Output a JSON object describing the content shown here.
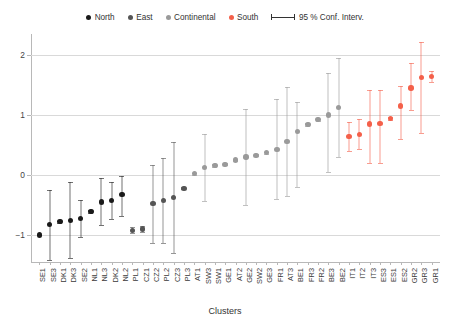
{
  "legend": {
    "items": [
      {
        "label": "North",
        "color": "#1a1a1a",
        "icon": "dot-icon"
      },
      {
        "label": "East",
        "color": "#555555",
        "icon": "dot-icon"
      },
      {
        "label": "Continental",
        "color": "#9a9a9a",
        "icon": "dot-icon"
      },
      {
        "label": "South",
        "color": "#f4604a",
        "icon": "dot-icon"
      }
    ],
    "ci_label": "95 % Conf. Interv.",
    "ci_icon": "error-bar-icon"
  },
  "axes": {
    "x_title": "Clusters",
    "y_ticks": [
      "2",
      "1",
      "0",
      "-1"
    ],
    "y_tick_values": [
      2,
      1,
      0,
      -1
    ],
    "ylim": [
      -1.45,
      2.35
    ],
    "grid": true
  },
  "chart_data": {
    "type": "scatter",
    "title": "",
    "xlabel": "Clusters",
    "ylabel": "",
    "ylim": [
      -1.45,
      2.35
    ],
    "y_ticks": [
      -1,
      0,
      1,
      2
    ],
    "grid": true,
    "legend_position": "top-center",
    "error_bars": "95 % Conf. Interv.",
    "categories": [
      "SE1",
      "SE3",
      "DK1",
      "DK3",
      "SE2",
      "NL1",
      "NL3",
      "DK2",
      "NL2",
      "PL1",
      "CZ1",
      "CZ2",
      "PL2",
      "CZ3",
      "PL3",
      "AT1",
      "SW3",
      "SW1",
      "GE1",
      "AT2",
      "GE2",
      "SW2",
      "GE3",
      "FR1",
      "AT3",
      "BE1",
      "FR3",
      "FR2",
      "BE3",
      "BE2",
      "IT1",
      "IT2",
      "IT3",
      "ES3",
      "ES1",
      "ES2",
      "GR2",
      "GR3",
      "GR1"
    ],
    "groups": [
      "North",
      "North",
      "North",
      "North",
      "North",
      "North",
      "North",
      "North",
      "North",
      "East",
      "East",
      "East",
      "East",
      "East",
      "East",
      "Continental",
      "Continental",
      "Continental",
      "Continental",
      "Continental",
      "Continental",
      "Continental",
      "Continental",
      "Continental",
      "Continental",
      "Continental",
      "Continental",
      "Continental",
      "Continental",
      "Continental",
      "South",
      "South",
      "South",
      "South",
      "South",
      "South",
      "South",
      "South",
      "South"
    ],
    "series": [
      {
        "name": "North",
        "color": "#1a1a1a",
        "points": [
          {
            "x": "SE1",
            "y": -1.0,
            "lo": -1.0,
            "hi": -1.0
          },
          {
            "x": "SE3",
            "y": -0.83,
            "lo": -1.42,
            "hi": -0.25
          },
          {
            "x": "DK1",
            "y": -0.78,
            "lo": -0.8,
            "hi": -0.76
          },
          {
            "x": "DK3",
            "y": -0.76,
            "lo": -1.38,
            "hi": -0.12
          },
          {
            "x": "SE2",
            "y": -0.73,
            "lo": -1.03,
            "hi": -0.42
          },
          {
            "x": "NL1",
            "y": -0.61,
            "lo": -0.63,
            "hi": -0.59
          },
          {
            "x": "NL3",
            "y": -0.45,
            "lo": -0.84,
            "hi": -0.05
          },
          {
            "x": "DK2",
            "y": -0.43,
            "lo": -0.73,
            "hi": -0.12
          },
          {
            "x": "NL2",
            "y": -0.32,
            "lo": -0.68,
            "hi": -0.01
          }
        ]
      },
      {
        "name": "East",
        "color": "#555555",
        "points": [
          {
            "x": "PL1",
            "y": -0.92,
            "lo": -0.97,
            "hi": -0.87
          },
          {
            "x": "CZ1",
            "y": -0.9,
            "lo": -0.95,
            "hi": -0.85
          },
          {
            "x": "CZ2",
            "y": -0.48,
            "lo": -1.13,
            "hi": 0.17
          },
          {
            "x": "PL2",
            "y": -0.42,
            "lo": -1.13,
            "hi": 0.29
          },
          {
            "x": "CZ3",
            "y": -0.38,
            "lo": -1.3,
            "hi": 0.55
          },
          {
            "x": "PL3",
            "y": -0.22,
            "lo": -0.24,
            "hi": -0.2
          }
        ]
      },
      {
        "name": "Continental",
        "color": "#9a9a9a",
        "points": [
          {
            "x": "AT1",
            "y": 0.02,
            "lo": 0.0,
            "hi": 0.04
          },
          {
            "x": "SW3",
            "y": 0.13,
            "lo": -0.43,
            "hi": 0.68
          },
          {
            "x": "SW1",
            "y": 0.16,
            "lo": 0.14,
            "hi": 0.18
          },
          {
            "x": "GE1",
            "y": 0.18,
            "lo": 0.16,
            "hi": 0.2
          },
          {
            "x": "AT2",
            "y": 0.25,
            "lo": 0.23,
            "hi": 0.27
          },
          {
            "x": "GE2",
            "y": 0.3,
            "lo": -0.5,
            "hi": 1.1
          },
          {
            "x": "SW2",
            "y": 0.33,
            "lo": 0.31,
            "hi": 0.35
          },
          {
            "x": "GE3",
            "y": 0.37,
            "lo": 0.35,
            "hi": 0.39
          },
          {
            "x": "FR1",
            "y": 0.43,
            "lo": -0.4,
            "hi": 1.27
          },
          {
            "x": "AT3",
            "y": 0.56,
            "lo": -0.35,
            "hi": 1.47
          },
          {
            "x": "BE1",
            "y": 0.72,
            "lo": -0.2,
            "hi": 1.22
          },
          {
            "x": "FR3",
            "y": 0.84,
            "lo": 0.82,
            "hi": 0.86
          },
          {
            "x": "FR2",
            "y": 0.92,
            "lo": 0.9,
            "hi": 0.94
          },
          {
            "x": "BE3",
            "y": 1.0,
            "lo": 0.05,
            "hi": 1.7
          },
          {
            "x": "BE2",
            "y": 1.12,
            "lo": 0.3,
            "hi": 1.95
          }
        ]
      },
      {
        "name": "South",
        "color": "#f4604a",
        "points": [
          {
            "x": "IT1",
            "y": 0.64,
            "lo": 0.4,
            "hi": 0.88
          },
          {
            "x": "IT2",
            "y": 0.68,
            "lo": 0.43,
            "hi": 0.94
          },
          {
            "x": "IT3",
            "y": 0.85,
            "lo": 0.2,
            "hi": 1.42
          },
          {
            "x": "ES3",
            "y": 0.86,
            "lo": 0.2,
            "hi": 1.42
          },
          {
            "x": "ES1",
            "y": 0.94,
            "lo": 0.92,
            "hi": 0.96
          },
          {
            "x": "ES2",
            "y": 1.15,
            "lo": 0.6,
            "hi": 1.48
          },
          {
            "x": "GR2",
            "y": 1.45,
            "lo": 1.08,
            "hi": 1.87
          },
          {
            "x": "GR3",
            "y": 1.62,
            "lo": 0.7,
            "hi": 2.22
          },
          {
            "x": "GR1",
            "y": 1.64,
            "lo": 1.55,
            "hi": 1.73
          }
        ]
      }
    ]
  }
}
